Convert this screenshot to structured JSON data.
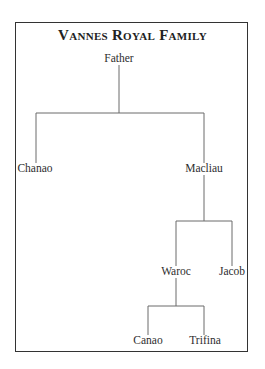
{
  "title": "Vannes Royal Family",
  "tree": {
    "root": "Father",
    "nodes": {
      "father": "Father",
      "chanao": "Chanao",
      "macliau": "Macliau",
      "waroc": "Waroc",
      "jacob": "Jacob",
      "canao": "Canao",
      "trifina": "Trifina"
    },
    "relations": [
      {
        "parent": "Father",
        "children": [
          "Chanao",
          "Macliau"
        ]
      },
      {
        "parent": "Macliau",
        "children": [
          "Waroc",
          "Jacob"
        ]
      },
      {
        "parent": "Waroc",
        "children": [
          "Canao",
          "Trifina"
        ]
      }
    ]
  },
  "colors": {
    "border": "#333333",
    "line": "#6a6a6a",
    "text": "#2e2e2e",
    "background": "#ffffff"
  }
}
